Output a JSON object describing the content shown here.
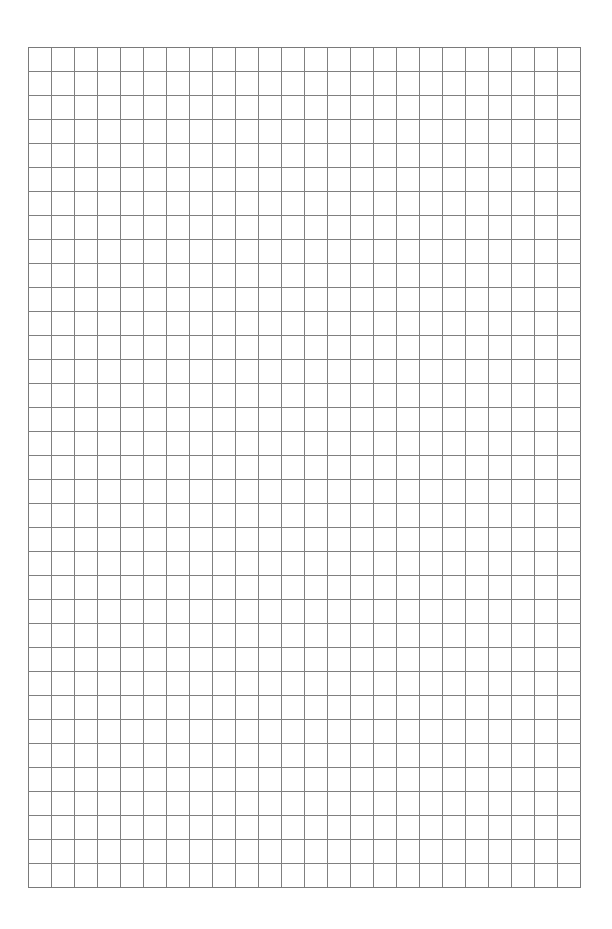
{
  "page": {
    "type": "graph-paper",
    "background_color": "#ffffff"
  },
  "grid": {
    "columns": 24,
    "rows": 35,
    "line_color": "#808080",
    "border_color": "#7a7a7a"
  }
}
